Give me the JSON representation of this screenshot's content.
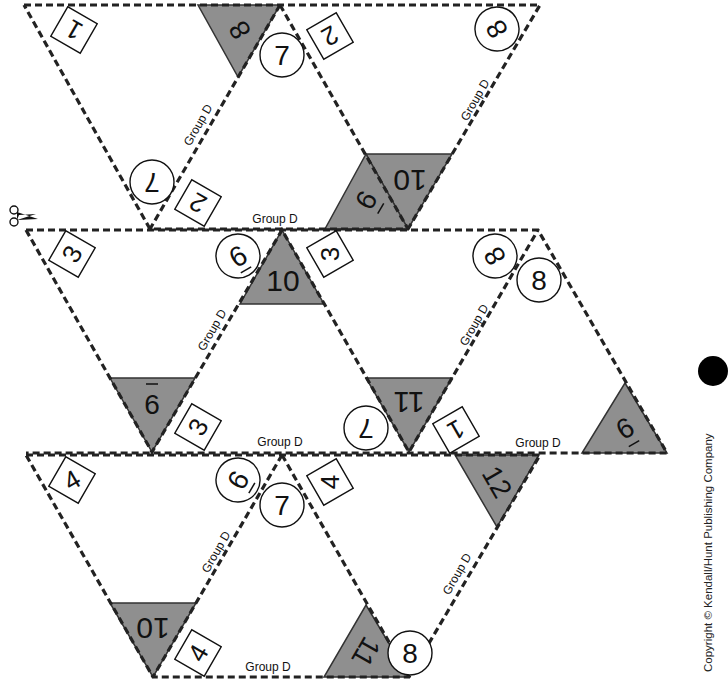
{
  "worksheet": {
    "group_label": "Group D",
    "copyright": "Copyright © Kendall/Hunt Publishing Company",
    "colors": {
      "shade": "#8f8f8f",
      "line": "#222222",
      "paper": "#ffffff"
    },
    "strips": [
      {
        "id": 1,
        "squares": [
          "1",
          "2",
          "2"
        ],
        "circles": [
          "7",
          "7",
          "8"
        ],
        "triangles": [
          "8",
          "10",
          "-9"
        ],
        "group_labels": [
          "Group D",
          "Group D",
          "Group D"
        ]
      },
      {
        "id": 2,
        "squares": [
          "3",
          "3",
          "3",
          "1"
        ],
        "circles": [
          "-9",
          "8",
          "8",
          "7"
        ],
        "triangles": [
          "10",
          "-6",
          "11",
          "-9"
        ],
        "group_labels": [
          "Group D",
          "Group D",
          "Group D",
          "Group D"
        ]
      },
      {
        "id": 3,
        "squares": [
          "4",
          "4",
          "4"
        ],
        "circles": [
          "-9",
          "7",
          "8"
        ],
        "triangles": [
          "12",
          "10",
          "11"
        ],
        "group_labels": [
          "Group D",
          "Group D",
          "Group D"
        ]
      }
    ]
  },
  "labels": {
    "s1_sq_a": "1",
    "s1_sq_b": "2",
    "s1_sq_c": "2",
    "s1_ci_a": "7",
    "s1_ci_b": "7",
    "s1_ci_c": "8",
    "s1_tr_a": "8",
    "s1_tr_b": "10",
    "s1_tr_c": "9",
    "s2_sq_a": "3",
    "s2_sq_b": "3",
    "s2_sq_c": "3",
    "s2_sq_d": "1",
    "s2_ci_a": "9",
    "s2_ci_b": "8",
    "s2_ci_c": "8",
    "s2_ci_d": "7",
    "s2_tr_a": "10",
    "s2_tr_b": "6",
    "s2_tr_c": "11",
    "s2_tr_d": "9",
    "s3_sq_a": "4",
    "s3_sq_b": "4",
    "s3_sq_c": "4",
    "s3_ci_a": "9",
    "s3_ci_b": "7",
    "s3_ci_c": "8",
    "s3_tr_a": "12",
    "s3_tr_b": "10",
    "s3_tr_c": "11",
    "group": "Group D"
  }
}
